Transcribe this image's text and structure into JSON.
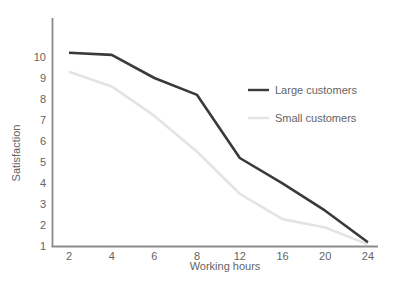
{
  "figure": {
    "background": "#ffffff"
  },
  "chart_data": {
    "type": "line",
    "title": "",
    "xlabel": "Working hours",
    "ylabel": "Satisfaction",
    "categories": [
      2,
      4,
      6,
      8,
      12,
      16,
      20,
      24
    ],
    "yticks": [
      1,
      2,
      3,
      4,
      5,
      6,
      7,
      8,
      9,
      10
    ],
    "ylim": [
      1,
      10.5
    ],
    "grid": false,
    "legend_position": "center-right",
    "axis_color": "#8b8b8b",
    "text_color": "#646464",
    "series": [
      {
        "name": "Large customers",
        "color": "#3a3a3c",
        "values": [
          10.2,
          10.1,
          9.0,
          8.2,
          5.2,
          4.0,
          2.7,
          1.2
        ]
      },
      {
        "name": "Small customers",
        "color": "#e4e4e4",
        "values": [
          9.3,
          8.6,
          7.2,
          5.5,
          3.5,
          2.3,
          1.9,
          1.1
        ]
      }
    ]
  }
}
